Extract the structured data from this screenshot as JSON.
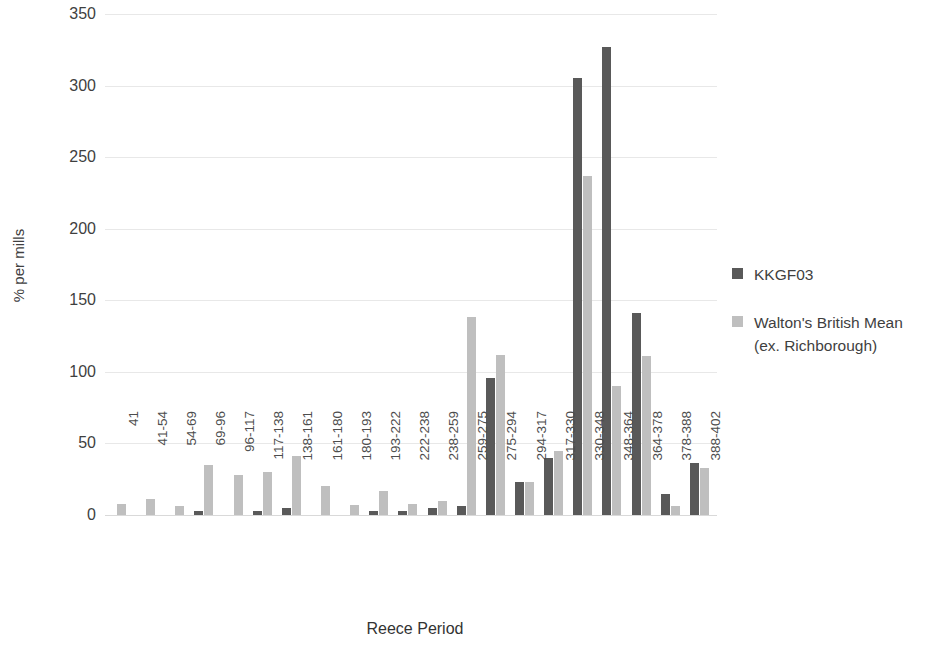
{
  "chart_data": {
    "type": "bar",
    "title": "",
    "xlabel": "Reece Period",
    "ylabel": "% per mills",
    "ylim": [
      0,
      350
    ],
    "yticks": [
      0,
      50,
      100,
      150,
      200,
      250,
      300,
      350
    ],
    "grid": true,
    "legend_position": "right",
    "categories": [
      "41",
      "41-54",
      "54-69",
      "69-96",
      "96-117",
      "117-138",
      "138-161",
      "161-180",
      "180-193",
      "193-222",
      "222-238",
      "238-259",
      "259-275",
      "275-294",
      "294-317",
      "317-330",
      "330-348",
      "348-364",
      "364-378",
      "378-388",
      "388-402"
    ],
    "series": [
      {
        "name": "KKGF03",
        "color": "#595959",
        "values": [
          0,
          0,
          0,
          3,
          0,
          3,
          5,
          0,
          0,
          3,
          3,
          5,
          6,
          96,
          23,
          40,
          305,
          327,
          141,
          15,
          36
        ]
      },
      {
        "name": "Walton's British Mean (ex. Richborough)",
        "color": "#bfbfbf",
        "values": [
          8,
          11,
          6,
          35,
          28,
          30,
          41,
          20,
          7,
          17,
          8,
          10,
          138,
          112,
          23,
          45,
          237,
          90,
          111,
          6,
          33
        ]
      }
    ]
  },
  "legend": {
    "items": [
      {
        "label": "KKGF03",
        "color": "#595959"
      },
      {
        "label": "Walton's British Mean (ex. Richborough)",
        "color": "#bfbfbf"
      }
    ]
  }
}
